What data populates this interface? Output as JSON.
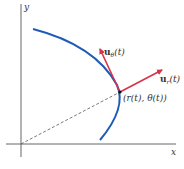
{
  "diagram": {
    "type": "polar-unit-vectors",
    "axes": {
      "x_label": "x",
      "y_label": "y"
    },
    "point_label": "(r(t), θ(t))",
    "vectors": [
      {
        "name": "u_r",
        "base": "u",
        "subscript": "r",
        "arg": "(t)",
        "color": "#d6334a"
      },
      {
        "name": "u_theta",
        "base": "u",
        "subscript": "θ",
        "arg": "(t)",
        "color": "#d6334a"
      }
    ],
    "curve_color": "#1f5bb5",
    "axis_color": "#555555",
    "radial_line": "dashed"
  }
}
